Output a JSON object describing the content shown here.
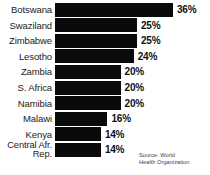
{
  "chart_data": {
    "type": "bar",
    "orientation": "horizontal",
    "title": "",
    "xlabel": "",
    "ylabel": "",
    "xlim": [
      0,
      36
    ],
    "grid": false,
    "legend": false,
    "categories": [
      "Botswana",
      "Swaziland",
      "Zimbabwe",
      "Lesotho",
      "Zambia",
      "S. Africa",
      "Namibia",
      "Malawi",
      "Kenya",
      "Central Afr. Rep."
    ],
    "values": [
      36,
      25,
      25,
      24,
      20,
      20,
      20,
      16,
      14,
      14
    ],
    "value_labels": [
      "36%",
      "25%",
      "25%",
      "24%",
      "20%",
      "20%",
      "20%",
      "16%",
      "14%",
      "14%"
    ],
    "bar_color": "#0a0a0a",
    "background_color": "#ffffff",
    "rows": [
      {
        "label": "Botswana",
        "label_line1": "Botswana",
        "label_line2": "",
        "value": 36,
        "value_label": "36%"
      },
      {
        "label": "Swaziland",
        "label_line1": "Swaziland",
        "label_line2": "",
        "value": 25,
        "value_label": "25%"
      },
      {
        "label": "Zimbabwe",
        "label_line1": "Zimbabwe",
        "label_line2": "",
        "value": 25,
        "value_label": "25%"
      },
      {
        "label": "Lesotho",
        "label_line1": "Lesotho",
        "label_line2": "",
        "value": 24,
        "value_label": "24%"
      },
      {
        "label": "Zambia",
        "label_line1": "Zambia",
        "label_line2": "",
        "value": 20,
        "value_label": "20%"
      },
      {
        "label": "S. Africa",
        "label_line1": "S. Africa",
        "label_line2": "",
        "value": 20,
        "value_label": "20%"
      },
      {
        "label": "Namibia",
        "label_line1": "Namibia",
        "label_line2": "",
        "value": 20,
        "value_label": "20%"
      },
      {
        "label": "Malawi",
        "label_line1": "Malawi",
        "label_line2": "",
        "value": 16,
        "value_label": "16%"
      },
      {
        "label": "Kenya",
        "label_line1": "Kenya",
        "label_line2": "",
        "value": 14,
        "value_label": "14%"
      },
      {
        "label": "Central Afr. Rep.",
        "label_line1": "Central",
        "label_line2": "Afr. Rep.",
        "value": 14,
        "value_label": "14%"
      }
    ]
  },
  "source": {
    "text": "Source: World\nHealth Organization"
  }
}
